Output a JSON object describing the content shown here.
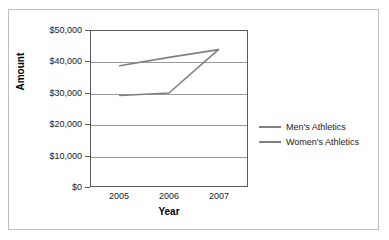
{
  "chart_data": {
    "type": "line",
    "title": "",
    "xlabel": "Year",
    "ylabel": "Amount",
    "x": [
      2005,
      2006,
      2007
    ],
    "categories": [
      "2005",
      "2006",
      "2007"
    ],
    "series": [
      {
        "name": "Men's Athletics",
        "values": [
          38800,
          41500,
          44000
        ],
        "color": "#808080"
      },
      {
        "name": "Women's Athletics",
        "values": [
          29200,
          30000,
          44000
        ],
        "color": "#808080"
      }
    ],
    "ylim": [
      0,
      50000
    ],
    "y_ticks": [
      0,
      10000,
      20000,
      30000,
      40000,
      50000
    ],
    "y_tick_labels": [
      "$0",
      "$10,000",
      "$20,000",
      "$30,000",
      "$40,000",
      "$50,000"
    ],
    "x_tick_labels": [
      "2005",
      "2006",
      "2007"
    ],
    "grid": "horizontal",
    "legend_position": "right",
    "legend_entries": [
      "Men's Athletics",
      "Women's Athletics"
    ]
  },
  "axes": {
    "y_title": "Amount",
    "x_title": "Year"
  },
  "legend": {
    "entries": [
      {
        "label": "Men's Athletics"
      },
      {
        "label": "Women's Athletics"
      }
    ]
  },
  "colors": {
    "series_line": "#808080",
    "gridline": "#9a9a9a",
    "axis": "#5a5a5a",
    "border": "#bfbfbf",
    "text": "#1a1a1a"
  }
}
